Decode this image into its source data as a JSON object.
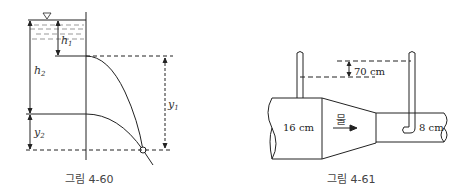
{
  "figure_60": {
    "caption": "그림 4-60",
    "labels": {
      "h1": "h",
      "h1_sub": "1",
      "h2": "h",
      "h2_sub": "2",
      "y1": "y",
      "y1_sub": "1",
      "y2": "y",
      "y2_sub": "2"
    },
    "free_surface_symbol": "▽"
  },
  "figure_61": {
    "caption": "그림 4-61",
    "head_difference": "70 cm",
    "large_diameter": "16 cm",
    "small_diameter": "8 cm",
    "flow_label": "물"
  }
}
